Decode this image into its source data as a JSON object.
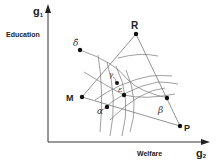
{
  "diagram": {
    "axes": {
      "y_axis": {
        "symbol": "g",
        "subscript": "1",
        "label": "Education"
      },
      "x_axis": {
        "symbol": "g",
        "subscript": "2",
        "label": "Welfare"
      }
    },
    "points": {
      "R": {
        "label": "R",
        "x": 136,
        "y": 34
      },
      "M": {
        "label": "M",
        "x": 82,
        "y": 97
      },
      "P": {
        "label": "P",
        "x": 180,
        "y": 126
      },
      "delta_hat": {
        "label": "δ̂",
        "x": 80,
        "y": 50
      },
      "alpha": {
        "label": "α",
        "x": 107,
        "y": 107
      },
      "epsilon": {
        "label": "ε",
        "x": 124,
        "y": 95
      },
      "gamma": {
        "label": "γ",
        "x": 115,
        "y": 81
      },
      "beta": {
        "label": "β",
        "x": 167,
        "y": 98
      }
    },
    "colors": {
      "line": "#555555",
      "axis": "#333333",
      "point": "#111111"
    }
  }
}
